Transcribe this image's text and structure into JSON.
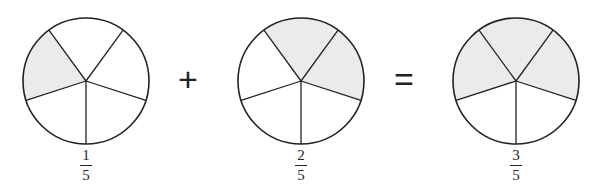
{
  "figure": {
    "colors": {
      "shaded": "#ebebeb",
      "stroke": "#222222",
      "background": "#ffffff"
    },
    "operators": {
      "plus": "+",
      "equals": "="
    },
    "circles": [
      {
        "id": "one-fifth",
        "cx": 86,
        "cy": 81,
        "r": 63,
        "slices": 5,
        "shaded_slices": [
          3
        ],
        "fraction": {
          "numerator": "1",
          "denominator": "5"
        }
      },
      {
        "id": "two-fifths",
        "cx": 301,
        "cy": 81,
        "r": 63,
        "slices": 5,
        "shaded_slices": [
          0,
          1
        ],
        "fraction": {
          "numerator": "2",
          "denominator": "5"
        }
      },
      {
        "id": "three-fifths",
        "cx": 516,
        "cy": 81,
        "r": 63,
        "slices": 5,
        "shaded_slices": [
          3,
          0,
          1
        ],
        "fraction": {
          "numerator": "3",
          "denominator": "5"
        }
      }
    ]
  }
}
